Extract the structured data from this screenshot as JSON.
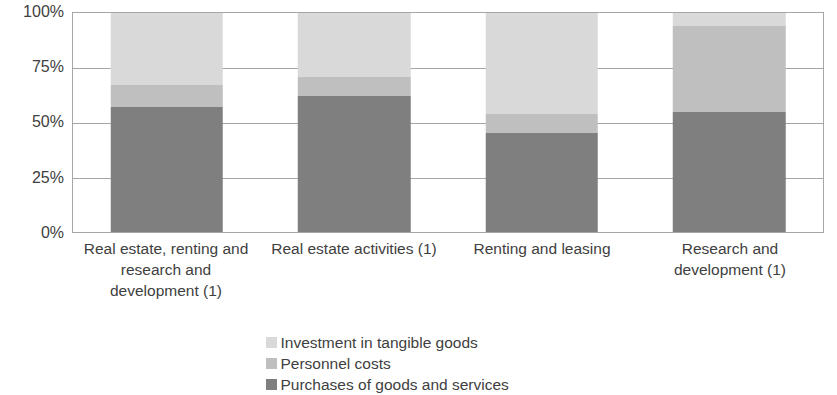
{
  "chart_data": {
    "type": "bar",
    "stacked": true,
    "normalized_percent": true,
    "title": "",
    "subtitle": "",
    "xlabel": "",
    "ylabel": "",
    "ylim": [
      0,
      100
    ],
    "grid": true,
    "legend_position": "bottom-center",
    "categories": [
      "Real estate, renting and research and development (1)",
      "Real estate activities (1)",
      "Renting and leasing",
      "Research and development (1)"
    ],
    "series": [
      {
        "name": "Purchases of goods and services",
        "color": "#7f7f7f",
        "values": [
          57,
          62,
          45,
          55
        ]
      },
      {
        "name": "Personnel costs",
        "color": "#bfbfbf",
        "values": [
          10,
          9,
          9,
          39
        ]
      },
      {
        "name": "Investment in tangible goods",
        "color": "#d9d9d9",
        "values": [
          33,
          29,
          46,
          6
        ]
      }
    ],
    "y_ticks": [
      {
        "value": 100,
        "label": "100%"
      },
      {
        "value": 75,
        "label": "75%"
      },
      {
        "value": 50,
        "label": "50%"
      },
      {
        "value": 25,
        "label": "25%"
      },
      {
        "value": 0,
        "label": "0%"
      }
    ],
    "legend_entries": [
      {
        "label": "Investment in tangible goods",
        "color": "#d9d9d9"
      },
      {
        "label": "Personnel costs",
        "color": "#bfbfbf"
      },
      {
        "label": "Purchases of goods and services",
        "color": "#7f7f7f"
      }
    ],
    "axis_color": "#a6a6a6",
    "text_color": "#404040",
    "background": "#ffffff"
  }
}
